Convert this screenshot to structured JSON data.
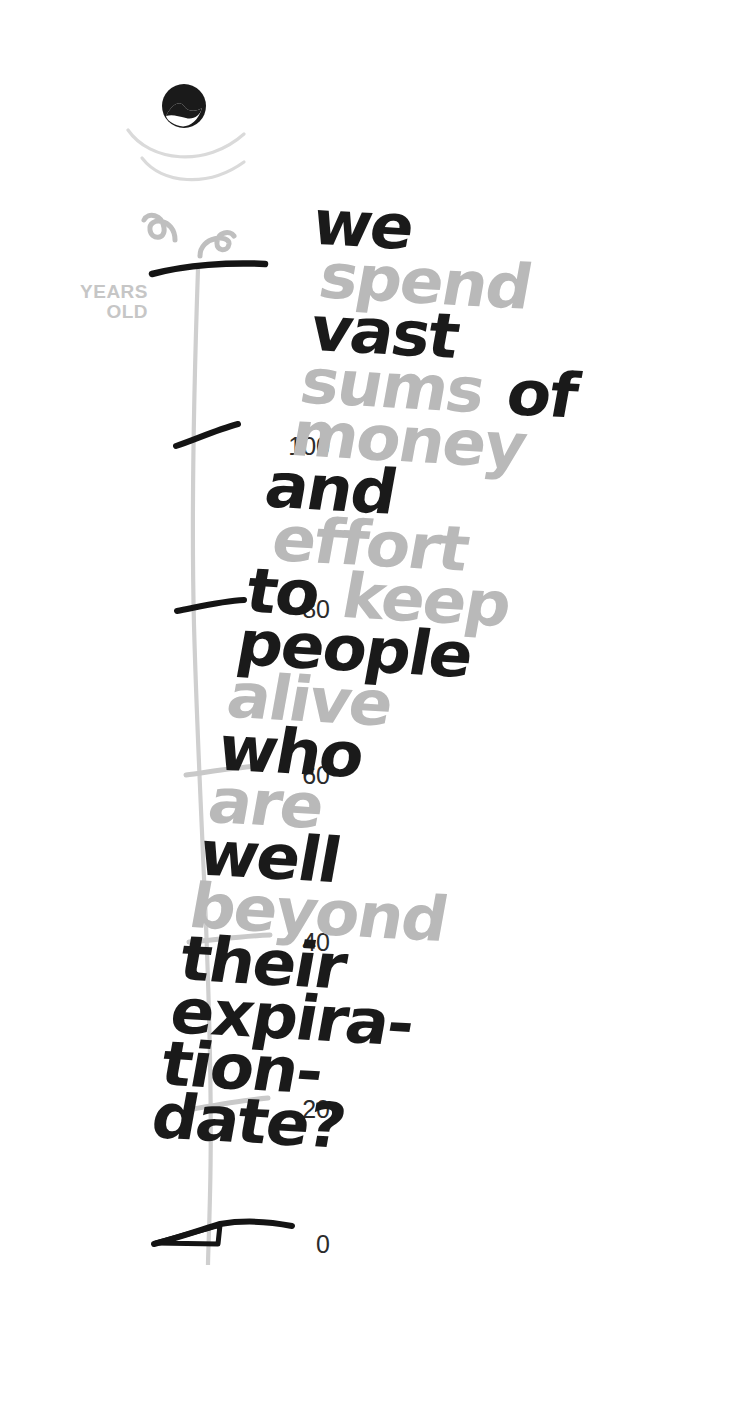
{
  "scale": {
    "axis_label": {
      "line1": "YEARS",
      "line2": "OLD"
    },
    "ticks": [
      {
        "value": "",
        "style": "black-bar",
        "top": 272
      },
      {
        "value": "100",
        "style": "black",
        "top": 434
      },
      {
        "value": "80",
        "style": "black",
        "top": 597
      },
      {
        "value": "60",
        "style": "gray",
        "top": 763
      },
      {
        "value": "40",
        "style": "gray",
        "top": 930
      },
      {
        "value": "20",
        "style": "gray",
        "top": 1097
      },
      {
        "value": "0",
        "style": "black-arrow",
        "top": 1232
      }
    ],
    "icons": {
      "head": "balloon-head-icon",
      "arcs": "arc-swoosh-icon",
      "curls": "spiral-curl-icon"
    }
  },
  "poem": {
    "full_text": "we spend vast sums of money and effort to keep people alive who are well beyond their expiration-date?",
    "lines": [
      {
        "id": "l1",
        "text": "we",
        "color": "black",
        "indent": 0
      },
      {
        "id": "l2",
        "text": "spend",
        "color": "gray",
        "indent": 1
      },
      {
        "id": "l3",
        "text": "vast",
        "color": "black",
        "indent": 1
      },
      {
        "id": "l4",
        "parts": [
          {
            "t": "sums",
            "c": "gray"
          },
          {
            "t": "of",
            "c": "black"
          }
        ],
        "indent": 1
      },
      {
        "id": "l5",
        "text": "money",
        "color": "gray",
        "indent": 1
      },
      {
        "id": "l6",
        "text": "and",
        "color": "black",
        "indent": 0
      },
      {
        "id": "l7",
        "text": "effort",
        "color": "gray",
        "indent": 1
      },
      {
        "id": "l8",
        "parts": [
          {
            "t": "to",
            "c": "black"
          },
          {
            "t": "keep",
            "c": "gray"
          }
        ],
        "indent": 0
      },
      {
        "id": "l9",
        "text": "people",
        "color": "black",
        "indent": 0
      },
      {
        "id": "l10",
        "text": "alive",
        "color": "gray",
        "indent": 0
      },
      {
        "id": "l11",
        "text": "who",
        "color": "black",
        "indent": 0
      },
      {
        "id": "l12",
        "text": "are",
        "color": "gray",
        "indent": 0
      },
      {
        "id": "l13",
        "text": "well",
        "color": "black",
        "indent": 0
      },
      {
        "id": "l14",
        "text": "beyond",
        "color": "gray",
        "indent": 0
      },
      {
        "id": "l15",
        "text": "their",
        "color": "black",
        "indent": 0
      },
      {
        "id": "l16",
        "text": "expira-",
        "color": "black",
        "indent": 0
      },
      {
        "id": "l17",
        "text": "tion-",
        "color": "black",
        "indent": 0
      },
      {
        "id": "l18",
        "text": "date?",
        "color": "black",
        "indent": 0
      }
    ]
  },
  "colors": {
    "ink_black": "#1a1a1a",
    "ink_gray": "#b9b9b9",
    "label_gray": "#c6c6c6",
    "axis_gray": "#cfcfcf",
    "background": "#ffffff"
  }
}
